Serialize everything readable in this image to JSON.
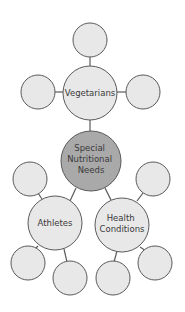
{
  "colors": {
    "background": "#ffffff",
    "node_fill": "#e8e8e8",
    "center_fill": "#a9a9a9",
    "stroke": "#5a5a5a",
    "text": "#3a3a3a"
  },
  "nodes": {
    "center": {
      "lines": [
        "Special",
        "Nutritional",
        "Needs"
      ]
    },
    "vegetarians": {
      "lines": [
        "Vegetarians"
      ]
    },
    "athletes": {
      "lines": [
        "Athletes"
      ]
    },
    "health": {
      "lines": [
        "Health",
        "Conditions"
      ]
    }
  }
}
